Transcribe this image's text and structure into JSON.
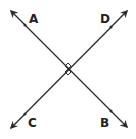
{
  "diagram": {
    "type": "perpendicular-lines",
    "colors": {
      "line": "#2a2a2a",
      "background": "#ffffff",
      "label": "#222222"
    },
    "intersection": {
      "x": 68,
      "y": 69,
      "right_angle_marks": true
    },
    "lines": [
      {
        "name": "line-AB",
        "from": {
          "x": 11,
          "y": 11
        },
        "to": {
          "x": 127,
          "y": 127
        },
        "arrows": "both",
        "points": [
          {
            "label": "A",
            "x": 25,
            "y": 25,
            "label_x": 33,
            "label_y": 23
          },
          {
            "label": "B",
            "x": 111,
            "y": 111,
            "label_x": 100,
            "label_y": 127
          }
        ]
      },
      {
        "name": "line-CD",
        "from": {
          "x": 11,
          "y": 128
        },
        "to": {
          "x": 127,
          "y": 11
        },
        "arrows": "both",
        "points": [
          {
            "label": "C",
            "x": 25,
            "y": 114,
            "label_x": 29,
            "label_y": 127
          },
          {
            "label": "D",
            "x": 111,
            "y": 27,
            "label_x": 100,
            "label_y": 23
          }
        ]
      }
    ],
    "labels": {
      "A": "A",
      "B": "B",
      "C": "C",
      "D": "D"
    }
  }
}
